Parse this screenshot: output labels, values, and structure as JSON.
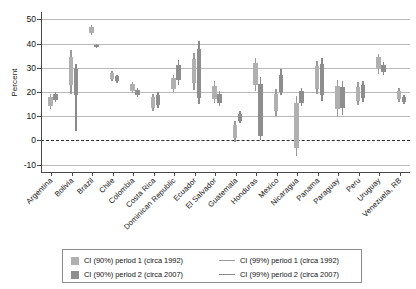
{
  "chart": {
    "ylabel": "Percent",
    "xlabel": "",
    "title": ""
  },
  "yaxis": {
    "ticks": [
      "50",
      "40",
      "30",
      "20",
      "10",
      "0",
      "-10"
    ],
    "values": [
      50,
      40,
      30,
      20,
      10,
      0,
      -10
    ],
    "min": -13,
    "max": 53
  },
  "legend": {
    "items": [
      {
        "marker": "box-light",
        "label": "CI (90%) period 1 (circa 1992)"
      },
      {
        "marker": "box-dark",
        "label": "CI (90%) period 2 (circa 2007)"
      },
      {
        "marker": "line-light",
        "label": "CI (99%) period 1 (circa 1992)"
      },
      {
        "marker": "line-dark",
        "label": "CI (99%) period 2 (circa 2007)"
      }
    ]
  },
  "chart_data": {
    "type": "box",
    "title": "",
    "xlabel": "",
    "ylabel": "Percent",
    "ylim": [
      -13,
      53
    ],
    "grid": true,
    "legend_position": "bottom",
    "categories": [
      "Argentina",
      "Bolivia",
      "Brazil",
      "Chile",
      "Colombia",
      "Costa Rica",
      "Dominican Republic",
      "Ecuador",
      "El Salvador",
      "Guatemala",
      "Honduras",
      "Mexico",
      "Nicaragua",
      "Panama",
      "Paraguay",
      "Peru",
      "Uruguay",
      "Venezuela, RB"
    ],
    "series": [
      {
        "name": "CI (90%) period 1 (circa 1992)",
        "note": "box = 90% CI, whisker = 99% CI",
        "boxes": [
          {
            "category": "Argentina",
            "ci90_low": 14.4,
            "ci90_high": 18.0,
            "ci99_low": 13.0,
            "ci99_high": 19.2
          },
          {
            "category": "Bolivia",
            "ci90_low": 22.8,
            "ci90_high": 34.6,
            "ci99_low": 19.0,
            "ci99_high": 37.4
          },
          {
            "category": "Brazil",
            "ci90_low": 44.4,
            "ci90_high": 46.8,
            "ci99_low": 43.6,
            "ci99_high": 47.6
          },
          {
            "category": "Chile",
            "ci90_low": 25.4,
            "ci90_high": 28.0,
            "ci99_low": 24.4,
            "ci99_high": 28.8
          },
          {
            "category": "Colombia",
            "ci90_low": 20.4,
            "ci90_high": 23.2,
            "ci99_low": 19.4,
            "ci99_high": 24.2
          },
          {
            "category": "Costa Rica",
            "ci90_low": 13.6,
            "ci90_high": 17.8,
            "ci99_low": 12.2,
            "ci99_high": 19.0
          },
          {
            "category": "Dominican Republic",
            "ci90_low": 21.2,
            "ci90_high": 25.6,
            "ci99_low": 19.8,
            "ci99_high": 27.0
          },
          {
            "category": "Ecuador",
            "ci90_low": 23.6,
            "ci90_high": 33.6,
            "ci99_low": 21.0,
            "ci99_high": 36.2
          },
          {
            "category": "El Salvador",
            "ci90_low": 17.0,
            "ci90_high": 22.6,
            "ci99_low": 15.4,
            "ci99_high": 24.6
          },
          {
            "category": "Guatemala",
            "ci90_low": 1.0,
            "ci90_high": 6.4,
            "ci99_low": -0.6,
            "ci99_high": 8.0
          },
          {
            "category": "Honduras",
            "ci90_low": 22.8,
            "ci90_high": 31.8,
            "ci99_low": 20.6,
            "ci99_high": 34.0
          },
          {
            "category": "Mexico",
            "ci90_low": 12.2,
            "ci90_high": 19.2,
            "ci99_low": 10.2,
            "ci99_high": 21.2
          },
          {
            "category": "Nicaragua",
            "ci90_low": -3.0,
            "ci90_high": 15.4,
            "ci99_low": -6.2,
            "ci99_high": 18.4
          },
          {
            "category": "Panama",
            "ci90_low": 21.2,
            "ci90_high": 30.6,
            "ci99_low": 19.0,
            "ci99_high": 32.8
          },
          {
            "category": "Paraguay",
            "ci90_low": 12.8,
            "ci90_high": 22.6,
            "ci99_low": 9.8,
            "ci99_high": 25.0
          },
          {
            "category": "Peru",
            "ci90_low": 16.4,
            "ci90_high": 22.2,
            "ci99_low": 14.6,
            "ci99_high": 24.0
          },
          {
            "category": "Uruguay",
            "ci90_low": 29.4,
            "ci90_high": 34.4,
            "ci99_low": 27.6,
            "ci99_high": 35.8
          },
          {
            "category": "Venezuela, RB",
            "ci90_low": 17.0,
            "ci90_high": 20.6,
            "ci99_low": 15.8,
            "ci99_high": 21.8
          }
        ]
      },
      {
        "name": "CI (90%) period 2 (circa 2007)",
        "note": "box = 90% CI, whisker = 99% CI",
        "boxes": [
          {
            "category": "Argentina",
            "ci90_low": 16.6,
            "ci90_high": 19.0,
            "ci99_low": 15.8,
            "ci99_high": 19.8
          },
          {
            "category": "Bolivia",
            "ci90_low": 18.6,
            "ci90_high": 29.4,
            "ci99_low": 4.0,
            "ci99_high": 31.4
          },
          {
            "category": "Brazil",
            "ci90_low": 38.4,
            "ci90_high": 39.4,
            "ci99_low": 38.0,
            "ci99_high": 39.8
          },
          {
            "category": "Chile",
            "ci90_low": 24.4,
            "ci90_high": 26.4,
            "ci99_low": 23.6,
            "ci99_high": 27.0
          },
          {
            "category": "Colombia",
            "ci90_low": 18.6,
            "ci90_high": 21.0,
            "ci99_low": 17.8,
            "ci99_high": 21.8
          },
          {
            "category": "Costa Rica",
            "ci90_low": 14.8,
            "ci90_high": 18.8,
            "ci99_low": 13.4,
            "ci99_high": 20.2
          },
          {
            "category": "Dominican Republic",
            "ci90_low": 25.0,
            "ci90_high": 31.2,
            "ci99_low": 23.0,
            "ci99_high": 33.2
          },
          {
            "category": "Ecuador",
            "ci90_low": 17.6,
            "ci90_high": 37.6,
            "ci99_low": 15.0,
            "ci99_high": 41.0
          },
          {
            "category": "El Salvador",
            "ci90_low": 15.4,
            "ci90_high": 19.2,
            "ci99_low": 14.2,
            "ci99_high": 20.4
          },
          {
            "category": "Guatemala",
            "ci90_low": 8.2,
            "ci90_high": 11.0,
            "ci99_low": 7.2,
            "ci99_high": 12.0
          },
          {
            "category": "Honduras",
            "ci90_low": 1.8,
            "ci90_high": 23.4,
            "ci99_low": 0.2,
            "ci99_high": 26.2
          },
          {
            "category": "Mexico",
            "ci90_low": 20.2,
            "ci90_high": 27.2,
            "ci99_low": 18.6,
            "ci99_high": 29.4
          },
          {
            "category": "Nicaragua",
            "ci90_low": 15.6,
            "ci90_high": 20.4,
            "ci99_low": 14.2,
            "ci99_high": 21.6
          },
          {
            "category": "Panama",
            "ci90_low": 18.8,
            "ci90_high": 31.6,
            "ci99_low": 16.4,
            "ci99_high": 34.0
          },
          {
            "category": "Paraguay",
            "ci90_low": 13.2,
            "ci90_high": 22.2,
            "ci99_low": 10.4,
            "ci99_high": 24.4
          },
          {
            "category": "Peru",
            "ci90_low": 17.6,
            "ci90_high": 23.0,
            "ci99_low": 16.0,
            "ci99_high": 24.6
          },
          {
            "category": "Uruguay",
            "ci90_low": 28.2,
            "ci90_high": 31.2,
            "ci99_low": 27.2,
            "ci99_high": 32.2
          },
          {
            "category": "Venezuela, RB",
            "ci90_low": 15.8,
            "ci90_high": 18.0,
            "ci99_low": 15.0,
            "ci99_high": 18.8
          }
        ]
      }
    ]
  }
}
